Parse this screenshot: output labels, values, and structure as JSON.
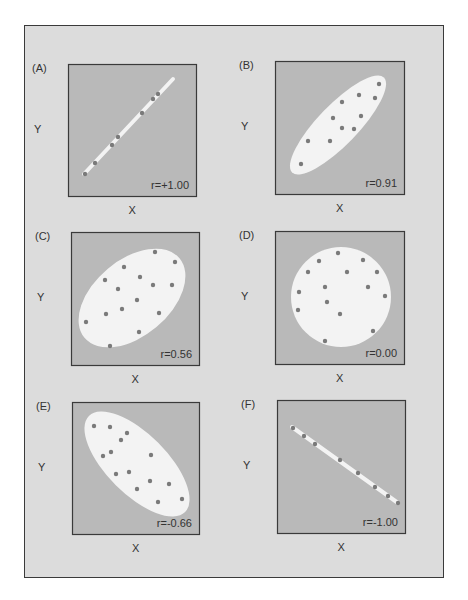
{
  "colors": {
    "frame_bg": "#dcdcdc",
    "panel_bg": "#b9b9b9",
    "region_fill": "#f3f3f3",
    "dot": "#7a7a7a",
    "border": "#3a3a3a"
  },
  "chart_data": {
    "type": "scatter",
    "title": "",
    "panels": [
      {
        "id": "A",
        "label": "(A)",
        "r_label": "r=+1.00",
        "r": 1.0,
        "xlabel": "X",
        "ylabel": "Y",
        "box": [
          68,
          64,
          129,
          133
        ],
        "region": {
          "type": "line",
          "x1": 16,
          "y1": 110,
          "x2": 105,
          "y2": 15
        },
        "points": [
          [
            17,
            110
          ],
          [
            27,
            99
          ],
          [
            44,
            81
          ],
          [
            50,
            73
          ],
          [
            74,
            49
          ],
          [
            85,
            35
          ],
          [
            90,
            30
          ]
        ]
      },
      {
        "id": "B",
        "label": "(B)",
        "r_label": "r=0.91",
        "r": 0.91,
        "xlabel": "X",
        "ylabel": "Y",
        "box": [
          275,
          61,
          130,
          134
        ],
        "region": {
          "type": "ellipse",
          "cx": 63,
          "cy": 64,
          "rx": 66,
          "ry": 20,
          "angle": -46
        },
        "points": [
          [
            26,
            103
          ],
          [
            33,
            80
          ],
          [
            55,
            80
          ],
          [
            58,
            57
          ],
          [
            67,
            41
          ],
          [
            67,
            67
          ],
          [
            79,
            68
          ],
          [
            84,
            34
          ],
          [
            86,
            55
          ],
          [
            100,
            37
          ],
          [
            104,
            23
          ]
        ]
      },
      {
        "id": "C",
        "label": "(C)",
        "r_label": "r=0.56",
        "r": 0.56,
        "xlabel": "X",
        "ylabel": "Y",
        "box": [
          71,
          232,
          129,
          134
        ],
        "region": {
          "type": "ellipse",
          "cx": 61,
          "cy": 66,
          "rx": 62,
          "ry": 38,
          "angle": -40
        },
        "points": [
          [
            84,
            20
          ],
          [
            104,
            30
          ],
          [
            53,
            35
          ],
          [
            34,
            48
          ],
          [
            69,
            45
          ],
          [
            82,
            53
          ],
          [
            101,
            53
          ],
          [
            47,
            57
          ],
          [
            66,
            68
          ],
          [
            51,
            77
          ],
          [
            35,
            82
          ],
          [
            88,
            81
          ],
          [
            15,
            90
          ],
          [
            68,
            100
          ],
          [
            39,
            114
          ]
        ]
      },
      {
        "id": "D",
        "label": "(D)",
        "r_label": "r=0.00",
        "r": 0.0,
        "xlabel": "X",
        "ylabel": "Y",
        "box": [
          275,
          231,
          130,
          134
        ],
        "region": {
          "type": "ellipse",
          "cx": 66,
          "cy": 66,
          "rx": 50,
          "ry": 50,
          "angle": 0
        },
        "points": [
          [
            63,
            22
          ],
          [
            44,
            30
          ],
          [
            88,
            29
          ],
          [
            33,
            41
          ],
          [
            72,
            41
          ],
          [
            102,
            41
          ],
          [
            50,
            56
          ],
          [
            93,
            56
          ],
          [
            24,
            61
          ],
          [
            110,
            65
          ],
          [
            52,
            71
          ],
          [
            23,
            79
          ],
          [
            65,
            83
          ],
          [
            98,
            100
          ],
          [
            50,
            110
          ]
        ]
      },
      {
        "id": "E",
        "label": "(E)",
        "r_label": "r=-0.66",
        "r": -0.66,
        "xlabel": "X",
        "ylabel": "Y",
        "box": [
          72,
          402,
          128,
          133
        ],
        "region": {
          "type": "ellipse",
          "cx": 65,
          "cy": 62,
          "rx": 68,
          "ry": 30,
          "angle": 45
        },
        "points": [
          [
            22,
            24
          ],
          [
            38,
            25
          ],
          [
            55,
            31
          ],
          [
            49,
            38
          ],
          [
            39,
            50
          ],
          [
            31,
            54
          ],
          [
            79,
            53
          ],
          [
            44,
            72
          ],
          [
            57,
            70
          ],
          [
            78,
            79
          ],
          [
            97,
            82
          ],
          [
            65,
            87
          ],
          [
            110,
            97
          ],
          [
            86,
            100
          ]
        ]
      },
      {
        "id": "F",
        "label": "(F)",
        "r_label": "r=-1.00",
        "r": -1.0,
        "xlabel": "X",
        "ylabel": "Y",
        "box": [
          277,
          400,
          129,
          134
        ],
        "region": {
          "type": "line",
          "x1": 15,
          "y1": 27,
          "x2": 121,
          "y2": 103
        },
        "points": [
          [
            16,
            28
          ],
          [
            27,
            36
          ],
          [
            38,
            44
          ],
          [
            63,
            60
          ],
          [
            81,
            73
          ],
          [
            98,
            87
          ],
          [
            111,
            96
          ],
          [
            121,
            103
          ]
        ]
      }
    ],
    "grid": false,
    "legend": null
  }
}
